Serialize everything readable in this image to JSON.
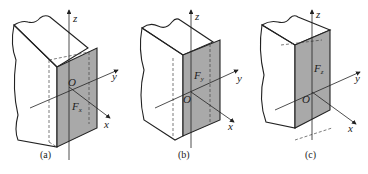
{
  "figure": {
    "panels": [
      {
        "id": "a",
        "caption": "(a)",
        "force_label": "F",
        "force_sub": "x",
        "origin": "O",
        "axes": {
          "x": "x",
          "y": "y",
          "z": "z"
        }
      },
      {
        "id": "b",
        "caption": "(b)",
        "force_label": "F",
        "force_sub": "y",
        "origin": "O",
        "axes": {
          "x": "x",
          "y": "y",
          "z": "z"
        }
      },
      {
        "id": "c",
        "caption": "(c)",
        "force_label": "F",
        "force_sub": "z",
        "origin": "O",
        "axes": {
          "x": "x",
          "y": "y",
          "z": "z"
        }
      }
    ],
    "colors": {
      "section_fill": "#a9a9a9",
      "line": "#222222",
      "background": "#ffffff"
    }
  }
}
